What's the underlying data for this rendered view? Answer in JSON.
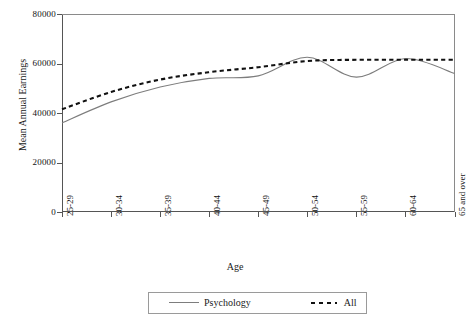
{
  "chart_data": {
    "type": "line",
    "title": "",
    "xlabel": "Age",
    "ylabel": "Mean Annual Earnings",
    "categories": [
      "25-29",
      "30-34",
      "35-39",
      "40-44",
      "45-49",
      "50-54",
      "55-59",
      "60-64",
      "65 and over"
    ],
    "ylim": [
      0,
      80000
    ],
    "yticks": [
      0,
      20000,
      40000,
      60000,
      80000
    ],
    "ytick_labels": [
      "0",
      "20000",
      "40000",
      "60000",
      "80000"
    ],
    "grid": false,
    "legend_position": "bottom-center",
    "series": [
      {
        "name": "Psychology",
        "style": "solid",
        "color": "#7d7d7d",
        "values": [
          36000,
          44500,
          50500,
          54000,
          55000,
          62500,
          54500,
          62000,
          56000
        ]
      },
      {
        "name": "All",
        "style": "dashed",
        "color": "#111111",
        "values": [
          41500,
          48500,
          53500,
          56500,
          58500,
          61000,
          61500,
          61500,
          61500
        ]
      }
    ]
  },
  "axes": {
    "y_title": "Mean Annual Earnings",
    "x_title": "Age"
  },
  "legend": {
    "items": [
      {
        "label": "Psychology",
        "style": "solid"
      },
      {
        "label": "All",
        "style": "dashed"
      }
    ]
  }
}
